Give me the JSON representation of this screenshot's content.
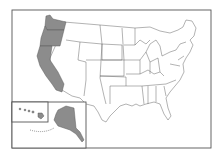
{
  "map": {
    "title": "United States",
    "highlight_color": "#8c8c8c",
    "base_color": "#ffffff",
    "border_color": "#555555",
    "highlighted_states": [
      "Washington",
      "Oregon",
      "California",
      "Alaska"
    ],
    "insets": [
      "Alaska",
      "Hawaii"
    ]
  }
}
